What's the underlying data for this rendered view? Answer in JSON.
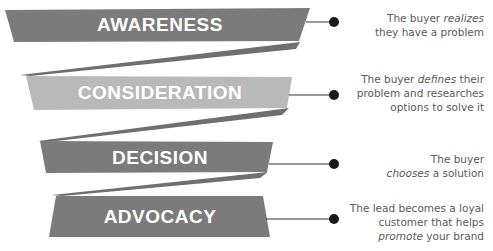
{
  "diagram": {
    "type": "zigzag-funnel",
    "colors": {
      "banner_dark": "#7b7b7b",
      "banner_light": "#b9b9b9",
      "connector": "#6f6f6f",
      "label_text": "#ffffff",
      "dot": "#1a1a1a",
      "description_text": "#5a5a5a"
    },
    "stages": [
      {
        "label": "AWARENESS",
        "description": {
          "pre": "The buyer ",
          "em": "realizes",
          "post": "",
          "line2": "they have a problem",
          "line3": ""
        }
      },
      {
        "label": "CONSIDERATION",
        "description": {
          "pre": "The buyer ",
          "em": "defines",
          "post": " their",
          "line2": "problem and researches",
          "line3": "options to solve it"
        }
      },
      {
        "label": "DECISION",
        "description": {
          "pre": "The buyer",
          "em": "",
          "post": "",
          "line2_em": "chooses",
          "line2": " a solution",
          "line3": ""
        }
      },
      {
        "label": "ADVOCACY",
        "description": {
          "pre": "The lead becomes a loyal",
          "em": "",
          "post": "",
          "line2": "customer that helps",
          "line3_em": "promote",
          "line3": " your brand"
        }
      }
    ]
  }
}
